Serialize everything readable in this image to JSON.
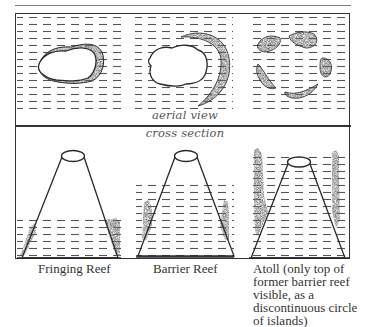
{
  "diagram": {
    "section_labels": {
      "aerial": "aerial view",
      "cross": "cross section"
    },
    "stages": [
      {
        "name": "Fringing Reef",
        "caption_lines": [
          "Fringing Reef"
        ]
      },
      {
        "name": "Barrier Reef",
        "caption_lines": [
          "Barrier Reef"
        ]
      },
      {
        "name": "Atoll",
        "caption_lines": [
          "Atoll (only top of",
          "former barrier reef",
          "visible, as a",
          "discontinuous circle",
          "of islands)"
        ]
      }
    ],
    "colors": {
      "line": "#2a2a2a",
      "water_dash": "#555555",
      "reef": "#3a3a3a"
    }
  }
}
